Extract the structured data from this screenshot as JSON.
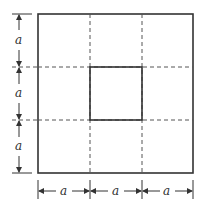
{
  "diagram": {
    "dimension_labels": {
      "left": [
        "a",
        "a",
        "a"
      ],
      "bottom": [
        "a",
        "a",
        "a"
      ]
    },
    "colors": {
      "line": "#333333",
      "background": "#ffffff"
    }
  }
}
